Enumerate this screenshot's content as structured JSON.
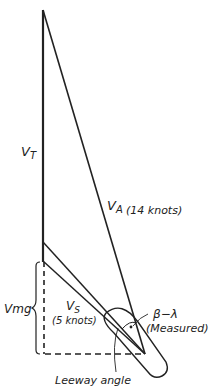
{
  "labels": {
    "vt_main": "V",
    "vt_sub": "T",
    "va_main": "V",
    "va_sub": "A",
    "va_speed": "(14 knots)",
    "vs_main": "V",
    "vs_sub": "S",
    "vs_speed": "(5 knots)",
    "vmg": "Vmg",
    "beta_lambda": "β−λ",
    "measured": "(Measured)",
    "leeway": "Leeway angle"
  },
  "colors": {
    "ink": "#222222",
    "background": "#ffffff"
  }
}
